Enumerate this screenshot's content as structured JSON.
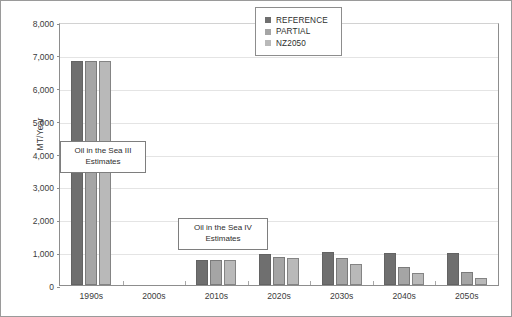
{
  "chart_data": {
    "type": "bar",
    "title": "",
    "xlabel": "",
    "ylabel": "MT/Year",
    "ylim": [
      0,
      8000
    ],
    "ytick_step": 1000,
    "ytick_labels": [
      "8,000",
      "7,000",
      "6,000",
      "5,000",
      "4,000",
      "3,000",
      "2,000",
      "1,000",
      "0"
    ],
    "ytick_values": [
      8000,
      7000,
      6000,
      5000,
      4000,
      3000,
      2000,
      1000,
      0
    ],
    "grid": true,
    "grid_axis": "y",
    "legend_position": "upper-center-right",
    "categories": [
      "1990s",
      "2000s",
      "2010s",
      "2020s",
      "2030s",
      "2040s",
      "2050s"
    ],
    "series": [
      {
        "name": "REFERENCE",
        "color": "#6f6f6f",
        "values": [
          6800,
          null,
          760,
          950,
          1000,
          980,
          970
        ]
      },
      {
        "name": "PARTIAL",
        "color": "#a5a5a5",
        "values": [
          6800,
          null,
          760,
          840,
          810,
          540,
          410
        ]
      },
      {
        "name": "NZ2050",
        "color": "#b9b9b9",
        "values": [
          6800,
          null,
          760,
          830,
          650,
          370,
          200
        ]
      }
    ],
    "annotations": [
      {
        "id": "oil-in-the-sea-iii",
        "line1": "Oil in the Sea III",
        "line2": "Estimates"
      },
      {
        "id": "oil-in-the-sea-iv",
        "line1": "Oil in the Sea IV",
        "line2": "Estimates"
      }
    ]
  },
  "colors": {
    "reference": "#6f6f6f",
    "partial": "#a5a5a5",
    "nz2050": "#b9b9b9",
    "axis": "#8d8d8d",
    "grid": "#e4e4e4",
    "text": "#3b3b3b",
    "frame": "#9a9a9a"
  }
}
